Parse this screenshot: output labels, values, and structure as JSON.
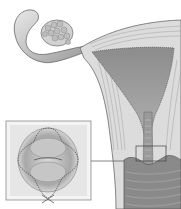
{
  "figure": {
    "labels": [],
    "colors": {
      "background": "#ffffff",
      "tissue_light": "#e2e2e2",
      "tissue_mid": "#b8b8b8",
      "tissue_dark": "#7a7a7a",
      "outline": "#5a5a5a",
      "inset_border": "#8a8a8a",
      "dashed_line": "#555555"
    },
    "inset": {
      "x": 6,
      "y": 121,
      "width": 85,
      "height": 79
    },
    "callout_box": {
      "x": 136,
      "y": 146,
      "width": 30,
      "height": 15
    }
  }
}
